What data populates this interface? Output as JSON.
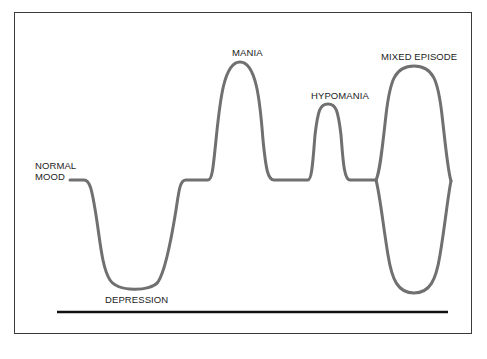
{
  "diagram": {
    "type": "mood-episode-curve",
    "labels": {
      "normal_mood_line1": "NORMAL",
      "normal_mood_line2": "MOOD",
      "depression": "DEPRESSION",
      "mania": "MANIA",
      "hypomania": "HYPOMANIA",
      "mixed_episode": "MIXED EPISODE"
    },
    "colors": {
      "curve": "#707070",
      "baseline": "#111111",
      "frame": "#3a3a3a"
    }
  }
}
